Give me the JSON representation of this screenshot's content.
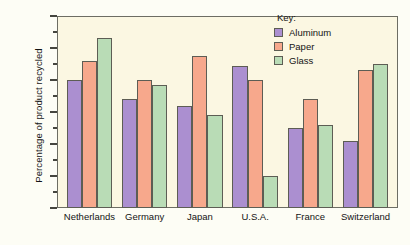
{
  "chart_data": {
    "type": "bar",
    "title": "",
    "xlabel": "",
    "ylabel": "Percentage of product recycled",
    "ylim": [
      0,
      60
    ],
    "ytick_step": 10,
    "yminor_step": 5,
    "grid": false,
    "legend_position": "top-right",
    "categories": [
      "Netherlands",
      "Germany",
      "Japan",
      "U.S.A.",
      "France",
      "Switzerland"
    ],
    "ytick_labels": [
      "0",
      "10",
      "20",
      "30",
      "40",
      "50",
      "60"
    ],
    "series": [
      {
        "name": "Aluminum",
        "color": "#ab8fd0",
        "values": [
          40,
          34,
          32,
          44.5,
          25,
          21
        ]
      },
      {
        "name": "Paper",
        "color": "#f7a88c",
        "values": [
          46,
          40,
          47.5,
          40,
          34,
          43
        ]
      },
      {
        "name": "Glass",
        "color": "#b9dcb6",
        "values": [
          53,
          38.5,
          29,
          10,
          26,
          45
        ]
      }
    ]
  },
  "legend": {
    "title": "Key:"
  },
  "colors": {
    "plot_background": "#fbf7e2",
    "frame": "#6d6d63",
    "bar_outline": "#5d5d54",
    "aluminum": "#ab8fd0",
    "paper": "#f7a88c",
    "glass": "#b9dcb6",
    "text": "#141414"
  }
}
